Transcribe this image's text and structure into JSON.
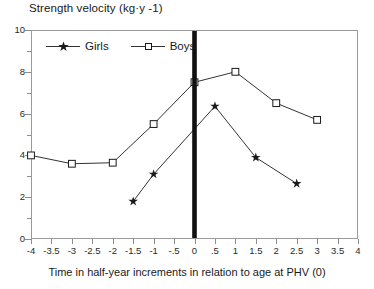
{
  "chart_data": {
    "type": "line",
    "title": "Strength velocity (kg·y -1)",
    "xlabel": "Time in half-year increments in relation to age at PHV (0)",
    "ylabel": "",
    "xlim": [
      -4,
      4
    ],
    "ylim": [
      0,
      10
    ],
    "grid": false,
    "legend_position": "top-left-inside",
    "x_ticks": [
      -4,
      -3.5,
      -3,
      -2.5,
      -2,
      -1.5,
      -1,
      -0.5,
      0,
      0.5,
      1,
      1.5,
      2,
      2.5,
      3,
      3.5,
      4
    ],
    "x_tick_labels": [
      "-4",
      "-3.5",
      "-3",
      "-2.5",
      "-2",
      "-1.5",
      "-1",
      "-.5",
      "0",
      ".5",
      "1",
      "1.5",
      "2",
      "2.5",
      "3",
      "3.5",
      "4"
    ],
    "y_ticks": [
      0,
      2,
      4,
      6,
      8,
      10
    ],
    "y_tick_labels": [
      "0",
      "2",
      "4",
      "6",
      "8",
      "10"
    ],
    "y_minor_ticks": [
      1,
      3,
      5,
      7,
      9
    ],
    "annotations": [
      {
        "name": "phv-marker",
        "type": "vertical-bar",
        "x": 0,
        "label": ""
      }
    ],
    "series": [
      {
        "name": "Girls",
        "marker": "star",
        "color": "#1a1a1a",
        "points": [
          {
            "x": -1.5,
            "y": 1.8
          },
          {
            "x": -1,
            "y": 3.1
          },
          {
            "x": 0.5,
            "y": 6.35
          },
          {
            "x": 1.5,
            "y": 3.9
          },
          {
            "x": 2.5,
            "y": 2.65
          }
        ]
      },
      {
        "name": "Boys",
        "marker": "square",
        "color": "#1a1a1a",
        "points": [
          {
            "x": -4,
            "y": 4.0
          },
          {
            "x": -3,
            "y": 3.6
          },
          {
            "x": -2,
            "y": 3.65
          },
          {
            "x": -1,
            "y": 5.5
          },
          {
            "x": 0,
            "y": 7.5
          },
          {
            "x": 1,
            "y": 8.0
          },
          {
            "x": 2,
            "y": 6.5
          },
          {
            "x": 3,
            "y": 5.7
          }
        ]
      }
    ]
  },
  "legend": {
    "entries": [
      {
        "label": "Girls",
        "marker": "star"
      },
      {
        "label": "Boys",
        "marker": "square"
      }
    ]
  },
  "colors": {
    "line": "#333333",
    "marker": "#1a1a1a",
    "frame": "#9a9a9a",
    "axis_text": "#2a2a2a",
    "phv_bar": "#111111",
    "background": "#ffffff"
  }
}
